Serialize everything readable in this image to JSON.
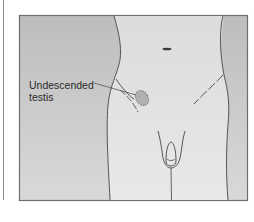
{
  "figure": {
    "annotations": [
      {
        "id": "undescended-testis",
        "label_line1": "Undescended",
        "label_line2": "testis"
      }
    ],
    "colors": {
      "frame": "#6e6e6e",
      "outside_body": "#c4c4c4",
      "body_fill": "#e2e2e2",
      "outline": "#555555",
      "testis_fill": "#b0b0b0"
    }
  }
}
